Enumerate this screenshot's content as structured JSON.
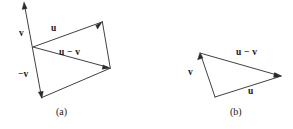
{
  "figure": {
    "stroke_color": "#2b2b2b",
    "text_color": "#1a1a1a",
    "background": "#ffffff",
    "panels": [
      {
        "id": "a",
        "caption": "(a)",
        "shape": "parallelogram-with-diagonal",
        "labels": {
          "v": "v",
          "neg_v": "−v",
          "u": "u",
          "u_minus_v": "u − v"
        },
        "points": {
          "origin": [
            33,
            47
          ],
          "u_tip": [
            102,
            22
          ],
          "umv_tip": [
            110,
            68
          ],
          "neg_v_tip": [
            41,
            97
          ],
          "v_tip": [
            24,
            3
          ]
        }
      },
      {
        "id": "b",
        "caption": "(b)",
        "shape": "triangle",
        "labels": {
          "v": "v",
          "u": "u",
          "u_minus_v": "u − v"
        },
        "points": {
          "v_tip": [
            200,
            53
          ],
          "u_tip": [
            281,
            76
          ],
          "origin": [
            215,
            97
          ]
        }
      }
    ]
  }
}
